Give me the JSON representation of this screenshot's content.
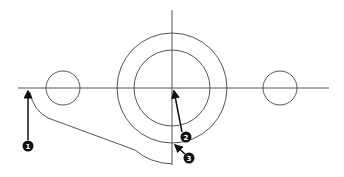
{
  "diagram": {
    "type": "technical-drawing",
    "colors": {
      "line": "#555555",
      "arrow": "#111111",
      "callout_fill": "#111111",
      "callout_text": "#ffffff",
      "background": "#ffffff"
    },
    "centerlines": {
      "horizontal": {
        "x1": 18,
        "y": 88,
        "x2": 329
      },
      "vertical": {
        "x": 172,
        "y1": 10,
        "y2": 165
      }
    },
    "circles": [
      {
        "id": "outer-circle",
        "cx": 172,
        "cy": 88,
        "r": 55
      },
      {
        "id": "inner-circle",
        "cx": 172,
        "cy": 88,
        "r": 38
      },
      {
        "id": "left-small-circle",
        "cx": 63,
        "cy": 88,
        "r": 17
      },
      {
        "id": "right-small-circle",
        "cx": 280,
        "cy": 88,
        "r": 17
      }
    ],
    "callouts": [
      {
        "number": "1",
        "cx": 28,
        "cy": 146,
        "tip_x": 28,
        "tip_y": 89
      },
      {
        "number": "2",
        "cx": 186,
        "cy": 137,
        "tip_x": 173,
        "tip_y": 89
      },
      {
        "number": "3",
        "cx": 189,
        "cy": 158,
        "tip_x": 174,
        "tip_y": 144
      }
    ]
  }
}
